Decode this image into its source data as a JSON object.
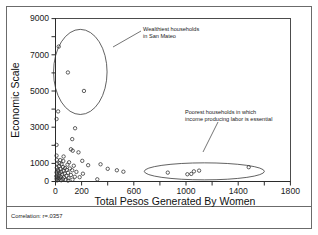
{
  "chart_data": {
    "type": "scatter",
    "title": "",
    "xlabel": "Total Pesos Generated By Women",
    "ylabel": "Economic Scale",
    "xlim": [
      0,
      1800
    ],
    "ylim": [
      0,
      9000
    ],
    "grid": false,
    "legend": "none",
    "xticks": [
      0,
      200,
      400,
      600,
      800,
      1000,
      1200,
      1400,
      1600,
      1800
    ],
    "xtick_labels": [
      "0",
      "200",
      "",
      "600",
      "",
      "1000",
      "",
      "1400",
      "",
      "1800"
    ],
    "yticks": [
      0,
      1000,
      2000,
      3000,
      4000,
      5000,
      6000,
      7000,
      8000,
      9000
    ],
    "ytick_labels": [
      "0",
      "1000",
      "",
      "3000",
      "",
      "5000",
      "",
      "7000",
      "",
      "9000"
    ],
    "marker": "open-circle",
    "points": [
      [
        25,
        7450
      ],
      [
        95,
        6020
      ],
      [
        218,
        5000
      ],
      [
        20,
        3870
      ],
      [
        8,
        3450
      ],
      [
        150,
        2940
      ],
      [
        128,
        2340
      ],
      [
        8,
        2020
      ],
      [
        118,
        1780
      ],
      [
        132,
        1700
      ],
      [
        176,
        1610
      ],
      [
        8,
        1430
      ],
      [
        62,
        1380
      ],
      [
        10,
        1200
      ],
      [
        36,
        1180
      ],
      [
        60,
        1130
      ],
      [
        205,
        1140
      ],
      [
        104,
        1060
      ],
      [
        30,
        1010
      ],
      [
        12,
        980
      ],
      [
        46,
        960
      ],
      [
        92,
        930
      ],
      [
        250,
        900
      ],
      [
        140,
        870
      ],
      [
        26,
        840
      ],
      [
        58,
        800
      ],
      [
        10,
        760
      ],
      [
        72,
        740
      ],
      [
        110,
        720
      ],
      [
        38,
        690
      ],
      [
        18,
        650
      ],
      [
        86,
        640
      ],
      [
        128,
        620
      ],
      [
        62,
        590
      ],
      [
        22,
        560
      ],
      [
        44,
        540
      ],
      [
        160,
        530
      ],
      [
        8,
        500
      ],
      [
        96,
        480
      ],
      [
        30,
        460
      ],
      [
        70,
        440
      ],
      [
        210,
        430
      ],
      [
        14,
        400
      ],
      [
        52,
        380
      ],
      [
        118,
        360
      ],
      [
        26,
        330
      ],
      [
        84,
        310
      ],
      [
        6,
        290
      ],
      [
        40,
        270
      ],
      [
        148,
        260
      ],
      [
        64,
        230
      ],
      [
        18,
        210
      ],
      [
        100,
        190
      ],
      [
        32,
        170
      ],
      [
        8,
        150
      ],
      [
        56,
        130
      ],
      [
        22,
        110
      ],
      [
        130,
        100
      ],
      [
        78,
        90
      ],
      [
        44,
        70
      ],
      [
        12,
        60
      ],
      [
        96,
        50
      ],
      [
        185,
        240
      ],
      [
        320,
        120
      ],
      [
        470,
        620
      ],
      [
        520,
        540
      ],
      [
        400,
        700
      ],
      [
        345,
        950
      ],
      [
        860,
        490
      ],
      [
        1010,
        400
      ],
      [
        1040,
        420
      ],
      [
        1060,
        560
      ],
      [
        1100,
        600
      ],
      [
        1480,
        790
      ]
    ],
    "highlights": [
      {
        "name": "wealthiest-cluster",
        "shape": "circle",
        "center_x": 190,
        "center_y": 6050,
        "radius_x": 205,
        "radius_y": 2350
      },
      {
        "name": "poorest-cluster",
        "shape": "ellipse",
        "center_x": 1140,
        "center_y": 560,
        "radius_x": 460,
        "radius_y": 470
      }
    ],
    "annotations": [
      {
        "name": "wealthiest-annotation",
        "lines": [
          "Wealthiest households",
          "in San Mateo"
        ],
        "text_x": 143,
        "text_y": 30
      },
      {
        "name": "poorest-annotation",
        "lines": [
          "Poorest households in which",
          "income producing labor is essential"
        ],
        "text_x": 185,
        "text_y": 112
      }
    ],
    "footnote": "Correlation: r=.0357"
  },
  "colors": {
    "marker_stroke": "#2e2e2e",
    "axis": "#2b2b2b",
    "frame": "#6b6b6b",
    "text": "#1a1a1a",
    "background": "#ffffff"
  }
}
